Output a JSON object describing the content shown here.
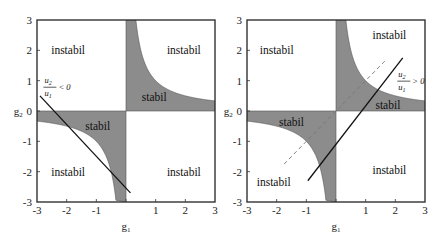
{
  "chart_data": [
    {
      "type": "area",
      "title": "",
      "xlabel": "g1",
      "ylabel": "g2",
      "xlim": [
        -3,
        3
      ],
      "ylim": [
        -3,
        3
      ],
      "xticks": [
        "-3",
        "-2",
        "-1",
        "0",
        "1",
        "2",
        "3"
      ],
      "yticks": [
        "-3",
        "-2",
        "-1",
        "0",
        "1",
        "2",
        "3"
      ],
      "grid": false,
      "stable_region_boundary": "hyperbola g1*g2 = 1 (shaded between hyperbola and axes in quadrants I and III)",
      "region_labels": [
        {
          "text": "instabil",
          "g1": -1.95,
          "g2": 2.0
        },
        {
          "text": "instabil",
          "g1": 1.95,
          "g2": 2.0
        },
        {
          "text": "stabil",
          "g1": 0.95,
          "g2": 0.45
        },
        {
          "text": "stabil",
          "g1": -0.95,
          "g2": -0.5
        },
        {
          "text": "instabil",
          "g1": -1.95,
          "g2": -2.0
        },
        {
          "text": "instabil",
          "g1": 1.95,
          "g2": -2.0
        }
      ],
      "lines": [
        {
          "style": "solid",
          "points": [
            [
              -2.9,
              0.5
            ],
            [
              0.15,
              -2.7
            ]
          ]
        }
      ],
      "annotation": {
        "numerator": "u2",
        "denominator": "u1",
        "relation": "< 0",
        "g1": -2.75,
        "g2": 0.85
      }
    },
    {
      "type": "area",
      "title": "",
      "xlabel": "g1",
      "ylabel": "g2",
      "xlim": [
        -3,
        3
      ],
      "ylim": [
        -3,
        3
      ],
      "xticks": [
        "-3",
        "-2",
        "-1",
        "0",
        "1",
        "2",
        "3"
      ],
      "yticks": [
        "-3",
        "-2",
        "-1",
        "0",
        "1",
        "2",
        "3"
      ],
      "grid": false,
      "stable_region_boundary": "hyperbola g1*g2 = 1 (shaded between hyperbola and axes in quadrants I and III)",
      "region_labels": [
        {
          "text": "instabil",
          "g1": -2.0,
          "g2": 2.0
        },
        {
          "text": "instabil",
          "g1": 1.8,
          "g2": 2.5
        },
        {
          "text": "stabil",
          "g1": 1.75,
          "g2": 0.2
        },
        {
          "text": "stabil",
          "g1": -1.5,
          "g2": -0.35
        },
        {
          "text": "instabil",
          "g1": -2.1,
          "g2": -2.35
        },
        {
          "text": "instabil",
          "g1": 1.8,
          "g2": -1.95
        }
      ],
      "lines": [
        {
          "style": "solid",
          "points": [
            [
              -0.95,
              -2.3
            ],
            [
              2.25,
              1.75
            ]
          ]
        },
        {
          "style": "dashed",
          "points": [
            [
              -1.75,
              -1.75
            ],
            [
              1.7,
              1.7
            ]
          ]
        }
      ],
      "annotation": {
        "numerator": "u2",
        "denominator": "u1",
        "relation": "> 0",
        "g1": 2.1,
        "g2": 1.05
      }
    }
  ],
  "labels": {
    "xlabel": "g",
    "xlabel_sub": "1",
    "ylabel": "g",
    "ylabel_sub": "2",
    "ticks": [
      "-3",
      "-2",
      "-1",
      "0",
      "1",
      "2",
      "3"
    ],
    "instabil": "instabil",
    "stabil": "stabil",
    "u": "u",
    "sub1": "1",
    "sub2": "2",
    "lt0": "< 0",
    "gt0": "> 0"
  },
  "style": {
    "shade": "#8c8c8c",
    "axis": "#333333",
    "line": "#111111",
    "dashed": "#777777"
  }
}
